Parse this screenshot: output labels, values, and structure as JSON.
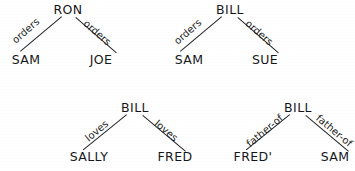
{
  "figure": {
    "type": "semantic-network-diagrams",
    "background_color": "#ffffff",
    "ink_color": "#1b1b1b",
    "diagram_count": 4
  },
  "diagrams": [
    {
      "id": "diagram-ron-orders",
      "root": "RON",
      "left_leaf": "SAM",
      "right_leaf": "JOE",
      "left_edge_label": "orders",
      "right_edge_label": "orders"
    },
    {
      "id": "diagram-bill-orders",
      "root": "BILL",
      "left_leaf": "SAM",
      "right_leaf": "SUE",
      "left_edge_label": "orders",
      "right_edge_label": "orders"
    },
    {
      "id": "diagram-bill-loves",
      "root": "BILL",
      "left_leaf": "SALLY",
      "right_leaf": "FRED",
      "left_edge_label": "loves",
      "right_edge_label": "loves"
    },
    {
      "id": "diagram-bill-father-of",
      "root": "BILL",
      "left_leaf": "FRED'",
      "right_leaf": "SAM",
      "left_edge_label": "father-of",
      "right_edge_label": "father-of"
    }
  ]
}
